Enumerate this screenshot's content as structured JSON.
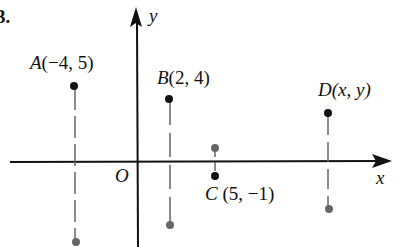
{
  "problem_number": "3.",
  "axes": {
    "x_label": "x",
    "y_label": "y",
    "origin_label": "O"
  },
  "points": [
    {
      "name": "A",
      "coords": "(−4, 5)",
      "x": -4,
      "y": 5
    },
    {
      "name": "B",
      "coords": "(2, 4)",
      "x": 2,
      "y": 4
    },
    {
      "name": "C",
      "coords": "(5, −1)",
      "x": 5,
      "y": -1
    },
    {
      "name": "D",
      "coords": "(x, y)",
      "x": "x",
      "y": "y"
    }
  ],
  "reflections": [
    {
      "of": "A",
      "description": "reflection across x-axis"
    },
    {
      "of": "B",
      "description": "reflection across x-axis"
    },
    {
      "of": "C",
      "description": "reflection across x-axis"
    },
    {
      "of": "D",
      "description": "reflection across x-axis"
    }
  ],
  "colors": {
    "point": "#111111",
    "reflected_point": "#6b6b6b",
    "axis": "#111111",
    "dashed": "#777777"
  }
}
